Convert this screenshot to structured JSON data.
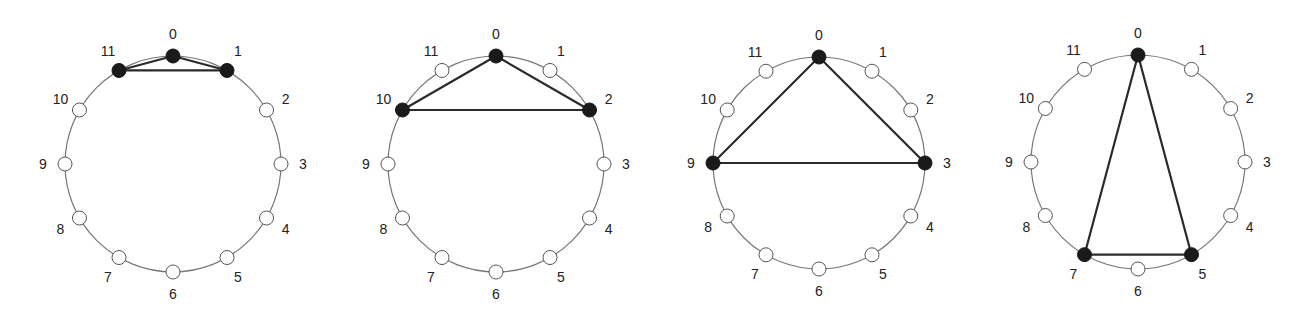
{
  "figure": {
    "node_count": 12,
    "node_labels": [
      "0",
      "1",
      "2",
      "3",
      "4",
      "5",
      "6",
      "7",
      "8",
      "9",
      "10",
      "11"
    ],
    "colors": {
      "background": "#ffffff",
      "circle_stroke": "#777777",
      "empty_node_fill": "#ffffff",
      "empty_node_stroke": "#555555",
      "filled_node": "#1a1a1a",
      "edge": "#2a2a2a",
      "label": "#222222"
    }
  },
  "panels": [
    {
      "id": "panel-1",
      "center": [
        173,
        164
      ],
      "radius": 108,
      "highlighted_nodes": [
        11,
        0,
        1
      ],
      "edges": [
        [
          11,
          0
        ],
        [
          0,
          1
        ],
        [
          11,
          1
        ]
      ]
    },
    {
      "id": "panel-2",
      "center": [
        496,
        164
      ],
      "radius": 108,
      "highlighted_nodes": [
        10,
        0,
        2
      ],
      "edges": [
        [
          10,
          0
        ],
        [
          0,
          2
        ],
        [
          10,
          2
        ]
      ]
    },
    {
      "id": "panel-3",
      "center": [
        819,
        163
      ],
      "radius": 106,
      "highlighted_nodes": [
        9,
        0,
        3
      ],
      "edges": [
        [
          9,
          0
        ],
        [
          0,
          3
        ],
        [
          9,
          3
        ]
      ]
    },
    {
      "id": "panel-4",
      "center": [
        1138,
        162
      ],
      "radius": 107,
      "highlighted_nodes": [
        7,
        0,
        5
      ],
      "edges": [
        [
          7,
          0
        ],
        [
          0,
          5
        ],
        [
          7,
          5
        ]
      ]
    }
  ]
}
